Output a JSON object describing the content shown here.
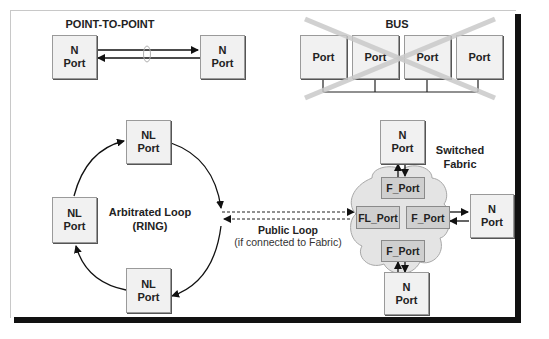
{
  "diagram": {
    "point_to_point": {
      "title": "POINT-TO-POINT",
      "left_port": {
        "line1": "N",
        "line2": "Port"
      },
      "right_port": {
        "line1": "N",
        "line2": "Port"
      }
    },
    "bus": {
      "title": "BUS",
      "ports": [
        "Port",
        "Port",
        "Port",
        "Port"
      ],
      "crossed_out": true,
      "cross_color": "#cfcfcf"
    },
    "arbitrated_loop": {
      "label_line1": "Arbitrated Loop",
      "label_line2": "(RING)",
      "ports": [
        {
          "position": "top",
          "line1": "NL",
          "line2": "Port"
        },
        {
          "position": "left",
          "line1": "NL",
          "line2": "Port"
        },
        {
          "position": "bottom",
          "line1": "NL",
          "line2": "Port"
        }
      ]
    },
    "public_loop": {
      "label_line1": "Public Loop",
      "label_line2": "(if connected to Fabric)"
    },
    "switched_fabric": {
      "label_line1": "Switched",
      "label_line2": "Fabric",
      "cloud_color": "#e4e4e4",
      "fabric_ports": {
        "top": "F_Port",
        "left": "FL_Port",
        "right": "F_Port",
        "bottom": "F_Port"
      },
      "n_ports": [
        {
          "position": "top",
          "line1": "N",
          "line2": "Port"
        },
        {
          "position": "right",
          "line1": "N",
          "line2": "Port"
        },
        {
          "position": "bottom",
          "line1": "N",
          "line2": "Port"
        }
      ]
    }
  }
}
